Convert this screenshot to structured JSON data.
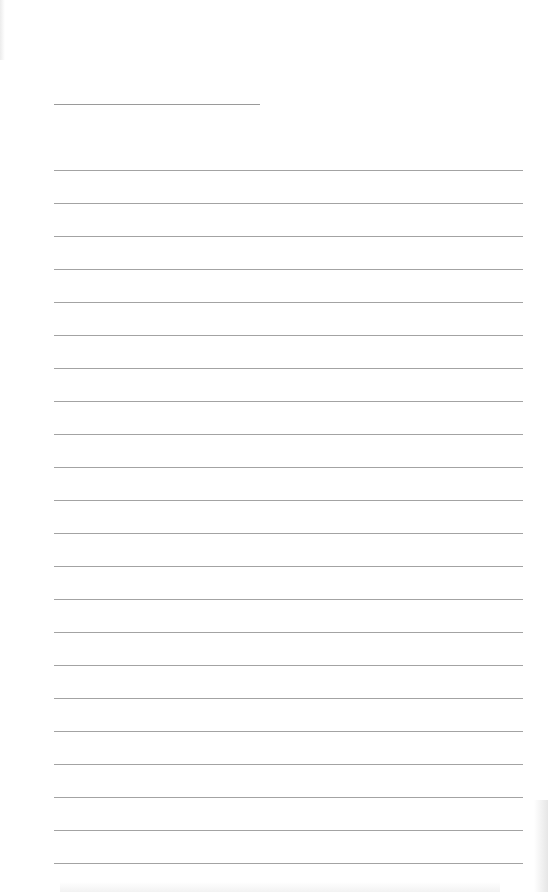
{
  "document": {
    "type": "lined-paper",
    "title_line": {
      "text": "",
      "top": 104,
      "left": 54,
      "width": 206
    },
    "ruled_lines": {
      "count": 22,
      "first_top": 170,
      "spacing": 33,
      "left": 54,
      "width": 469,
      "color": "#a3a3a3",
      "entries": [
        "",
        "",
        "",
        "",
        "",
        "",
        "",
        "",
        "",
        "",
        "",
        "",
        "",
        "",
        "",
        "",
        "",
        "",
        "",
        "",
        "",
        ""
      ]
    },
    "background_color": "#ffffff"
  }
}
